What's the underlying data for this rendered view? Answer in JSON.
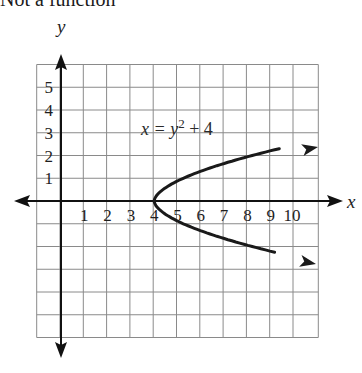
{
  "title": "Not a function",
  "chart_data": {
    "type": "line",
    "title": "Not a function",
    "xlabel": "x",
    "ylabel": "y",
    "xlim": [
      -1,
      11
    ],
    "ylim": [
      -6,
      6
    ],
    "grid": true,
    "x_ticks": [
      "1",
      "2",
      "3",
      "4",
      "5",
      "6",
      "7",
      "8",
      "9",
      "10"
    ],
    "y_ticks": [
      "1",
      "2",
      "3",
      "4",
      "5"
    ],
    "annotation": "x = y² + 4",
    "series": [
      {
        "name": "x = y^2 + 4",
        "x": [
          10.7,
          8.0,
          6.25,
          5.0,
          4.25,
          4.0,
          4.25,
          5.0,
          6.25,
          8.0,
          10.7
        ],
        "y": [
          2.4,
          2.0,
          1.5,
          1.0,
          0.5,
          0,
          -0.5,
          -1.0,
          -1.5,
          -2.0,
          -2.4
        ],
        "arrows_at_ends": true
      }
    ]
  },
  "labels": {
    "x_axis": "x",
    "y_axis": "y",
    "equation_lhs": "x = y",
    "equation_exp": "2",
    "equation_rhs": " + 4"
  }
}
